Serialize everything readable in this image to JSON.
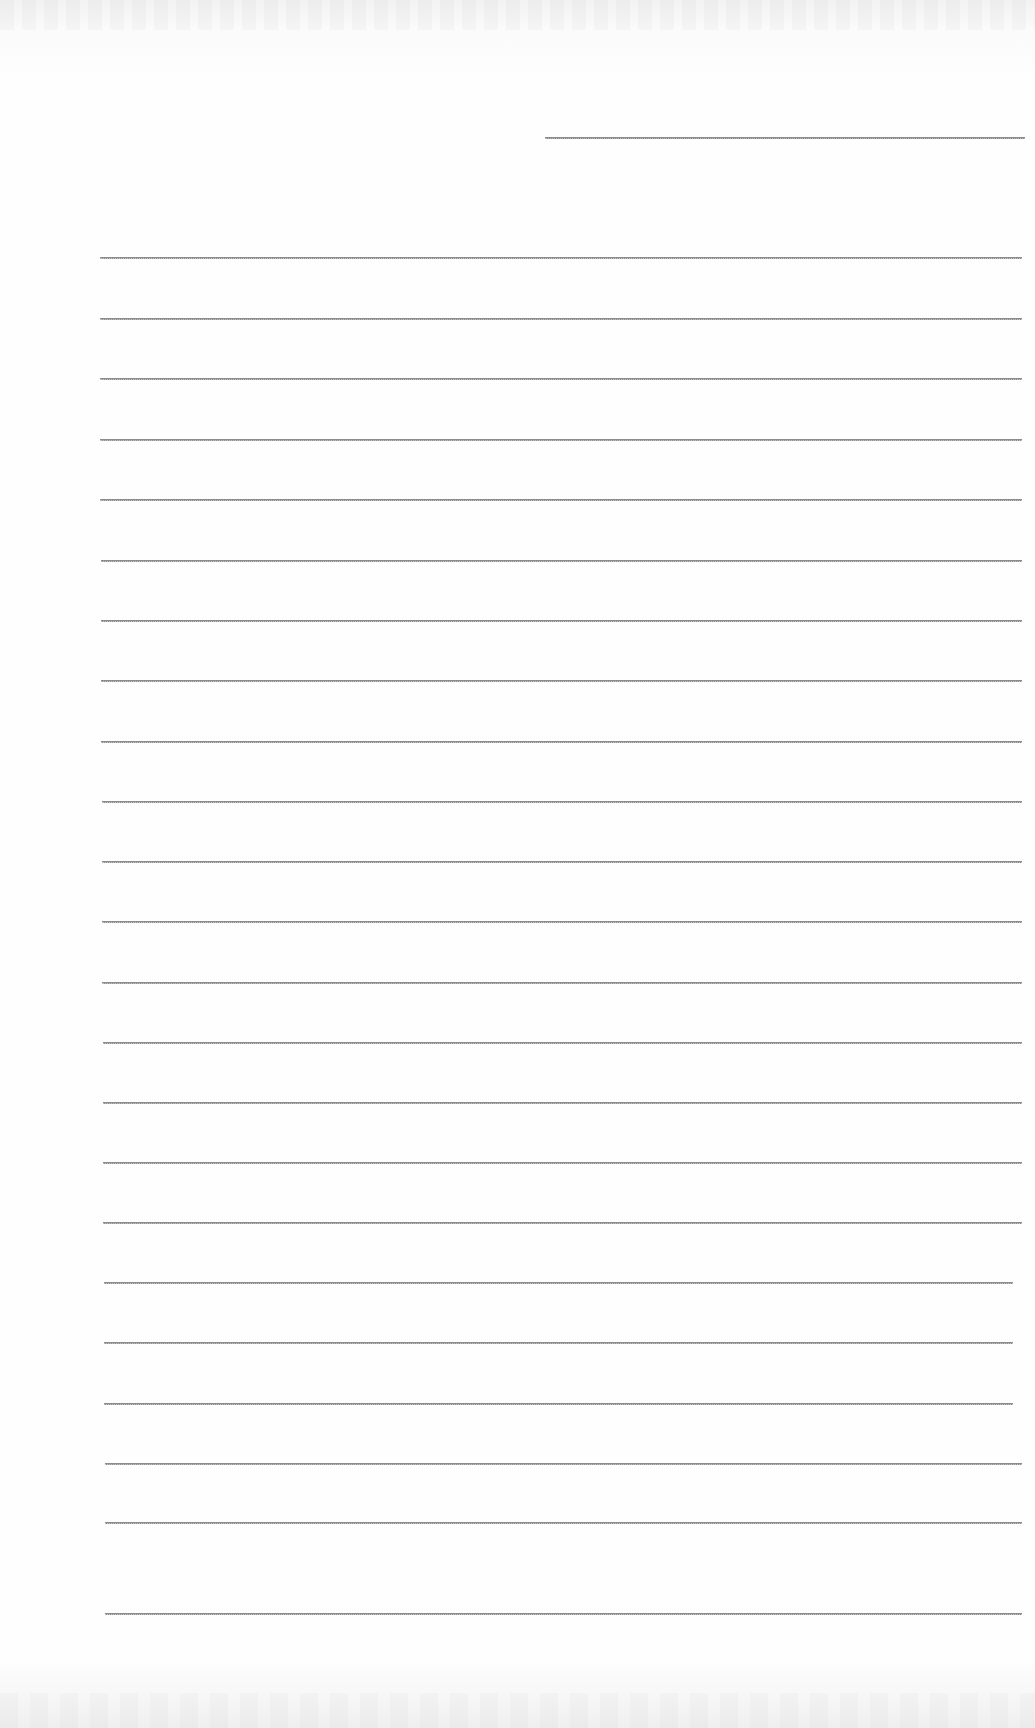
{
  "document": {
    "type": "lined-paper",
    "text": "",
    "header_field": {
      "x1": 545,
      "x2": 1025,
      "y": 137
    },
    "rule_count": 22,
    "rules": [
      {
        "y": 257,
        "x1": 100,
        "x2": 1022
      },
      {
        "y": 318,
        "x1": 100,
        "x2": 1022
      },
      {
        "y": 378,
        "x1": 100,
        "x2": 1022
      },
      {
        "y": 439,
        "x1": 100,
        "x2": 1022
      },
      {
        "y": 499,
        "x1": 100,
        "x2": 1022
      },
      {
        "y": 560,
        "x1": 101,
        "x2": 1022
      },
      {
        "y": 620,
        "x1": 101,
        "x2": 1022
      },
      {
        "y": 680,
        "x1": 101,
        "x2": 1022
      },
      {
        "y": 741,
        "x1": 101,
        "x2": 1022
      },
      {
        "y": 801,
        "x1": 102,
        "x2": 1022
      },
      {
        "y": 861,
        "x1": 102,
        "x2": 1022
      },
      {
        "y": 921,
        "x1": 102,
        "x2": 1022
      },
      {
        "y": 982,
        "x1": 102,
        "x2": 1022
      },
      {
        "y": 1042,
        "x1": 103,
        "x2": 1022
      },
      {
        "y": 1102,
        "x1": 103,
        "x2": 1022
      },
      {
        "y": 1162,
        "x1": 103,
        "x2": 1022
      },
      {
        "y": 1222,
        "x1": 103,
        "x2": 1022
      },
      {
        "y": 1282,
        "x1": 104,
        "x2": 1013
      },
      {
        "y": 1342,
        "x1": 104,
        "x2": 1013
      },
      {
        "y": 1403,
        "x1": 104,
        "x2": 1013
      },
      {
        "y": 1463,
        "x1": 105,
        "x2": 1022
      },
      {
        "y": 1522,
        "x1": 105,
        "x2": 1022
      },
      {
        "y": 1613,
        "x1": 105,
        "x2": 1022
      }
    ],
    "colors": {
      "paper": "#fdfdfd",
      "rule": "#8c8c8c"
    }
  }
}
